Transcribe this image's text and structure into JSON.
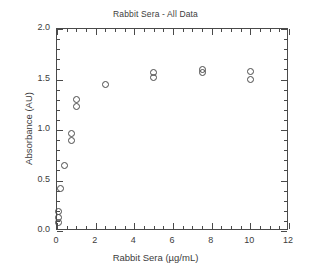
{
  "chart_data": {
    "type": "scatter",
    "title": "Rabbit Sera - All Data",
    "xlabel": "Rabbit Sera (µg/mL)",
    "ylabel": "Absorbance (AU)",
    "xlim": [
      0,
      12
    ],
    "ylim": [
      0.0,
      2.0
    ],
    "x_major_tick_step": 2,
    "x_minor_tick_step": 0.5,
    "y_major_tick_step": 0.5,
    "y_minor_tick_step": 0.1,
    "grid": false,
    "legend": null,
    "marker": "open-circle",
    "marker_color": "#4a4a4a",
    "xticklabels": [
      "0",
      "2",
      "4",
      "6",
      "8",
      "10",
      "12"
    ],
    "xtickvalues": [
      0,
      2,
      4,
      6,
      8,
      10,
      12
    ],
    "yticklabels": [
      "0.0",
      "0.5",
      "1.0",
      "1.5",
      "2.0"
    ],
    "ytickvalues": [
      0.0,
      0.5,
      1.0,
      1.5,
      2.0
    ],
    "points": [
      {
        "x": 0.1,
        "y": 0.08
      },
      {
        "x": 0.1,
        "y": 0.13
      },
      {
        "x": 0.1,
        "y": 0.19
      },
      {
        "x": 0.2,
        "y": 0.42
      },
      {
        "x": 0.4,
        "y": 0.65
      },
      {
        "x": 0.75,
        "y": 0.9
      },
      {
        "x": 0.75,
        "y": 0.97
      },
      {
        "x": 1.0,
        "y": 1.23
      },
      {
        "x": 1.0,
        "y": 1.3
      },
      {
        "x": 2.5,
        "y": 1.45
      },
      {
        "x": 5.0,
        "y": 1.52
      },
      {
        "x": 5.0,
        "y": 1.57
      },
      {
        "x": 7.5,
        "y": 1.57
      },
      {
        "x": 7.5,
        "y": 1.6
      },
      {
        "x": 10.0,
        "y": 1.5
      },
      {
        "x": 10.0,
        "y": 1.58
      }
    ]
  }
}
